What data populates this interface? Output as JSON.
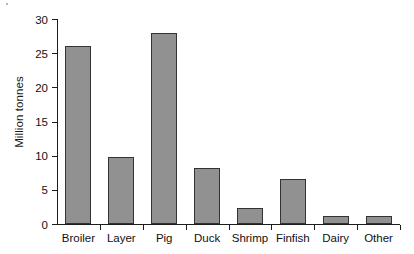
{
  "chart_data": {
    "type": "bar",
    "title": "",
    "subtitle": "",
    "xlabel": "",
    "ylabel": "Million tonnes",
    "categories": [
      "Broiler",
      "Layer",
      "Pig",
      "Duck",
      "Shrimp",
      "Finfish",
      "Dairy",
      "Other"
    ],
    "values": [
      26.0,
      9.8,
      28.0,
      8.2,
      2.3,
      6.6,
      1.2,
      1.2
    ],
    "series": [
      {
        "name": "Production",
        "values": [
          26.0,
          9.8,
          28.0,
          8.2,
          2.3,
          6.6,
          1.2,
          1.2
        ]
      }
    ],
    "ylim": [
      0,
      30
    ],
    "yticks": [
      0,
      5,
      10,
      15,
      20,
      25,
      30
    ],
    "ytick_labels": [
      "0",
      "5",
      "10",
      "15",
      "20",
      "25",
      "30"
    ],
    "grid": false,
    "legend": false,
    "legend_position": "none",
    "bar_color": "#919191",
    "bar_edge_color": "#333333",
    "axis_color": "#1d1d1d",
    "background_color": "#ffffff",
    "text_color": "#111111"
  }
}
